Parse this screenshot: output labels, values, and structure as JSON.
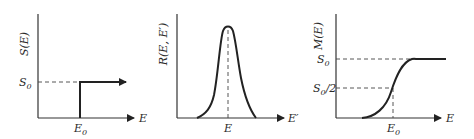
{
  "panels": [
    {
      "id": "step",
      "ylabel": "S(E)",
      "xlabel": "E",
      "y_tick": {
        "base": "S",
        "sub": "0"
      },
      "x_tick": {
        "base": "E",
        "sub": "0"
      }
    },
    {
      "id": "response",
      "ylabel": "R(E, E′)",
      "xlabel": "E′",
      "x_tick": {
        "base": "E"
      }
    },
    {
      "id": "measured",
      "ylabel": "M(E)",
      "xlabel": "E",
      "y_ticks": [
        {
          "base": "S",
          "sub": "0",
          "suffix": ""
        },
        {
          "base": "S",
          "sub": "0",
          "suffix": "/2"
        }
      ],
      "x_tick": {
        "base": "E",
        "sub": "0"
      }
    }
  ]
}
